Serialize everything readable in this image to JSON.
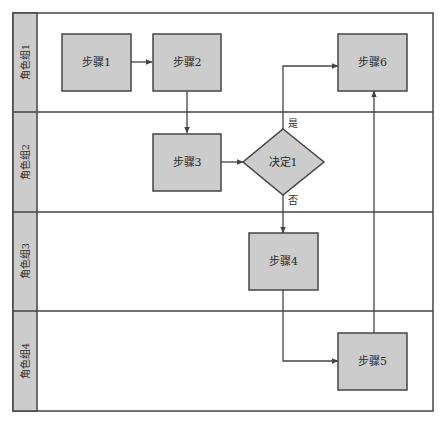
{
  "diagram": {
    "type": "swimlane-flowchart",
    "colors": {
      "node_fill": "#cccccc",
      "lane_header_fill": "#cccccc",
      "stroke": "#444444",
      "background": "#ffffff"
    },
    "lanes": [
      {
        "id": "lane1",
        "label": "角色组1"
      },
      {
        "id": "lane2",
        "label": "角色组2"
      },
      {
        "id": "lane3",
        "label": "角色组3"
      },
      {
        "id": "lane4",
        "label": "角色组4"
      }
    ],
    "nodes": [
      {
        "id": "step1",
        "shape": "rect",
        "label": "步骤1",
        "lane": "lane1"
      },
      {
        "id": "step2",
        "shape": "rect",
        "label": "步骤2",
        "lane": "lane1"
      },
      {
        "id": "step6",
        "shape": "rect",
        "label": "步骤6",
        "lane": "lane1"
      },
      {
        "id": "step3",
        "shape": "rect",
        "label": "步骤3",
        "lane": "lane2"
      },
      {
        "id": "decision1",
        "shape": "diamond",
        "label": "决定1",
        "lane": "lane2"
      },
      {
        "id": "step4",
        "shape": "rect",
        "label": "步骤4",
        "lane": "lane3"
      },
      {
        "id": "step5",
        "shape": "rect",
        "label": "步骤5",
        "lane": "lane4"
      }
    ],
    "edges": [
      {
        "from": "step1",
        "to": "step2",
        "label": ""
      },
      {
        "from": "step2",
        "to": "step3",
        "label": ""
      },
      {
        "from": "step3",
        "to": "decision1",
        "label": ""
      },
      {
        "from": "decision1",
        "to": "step6",
        "label": "是"
      },
      {
        "from": "decision1",
        "to": "step4",
        "label": "否"
      },
      {
        "from": "step4",
        "to": "step5",
        "label": ""
      },
      {
        "from": "step5",
        "to": "step6",
        "label": ""
      }
    ]
  }
}
